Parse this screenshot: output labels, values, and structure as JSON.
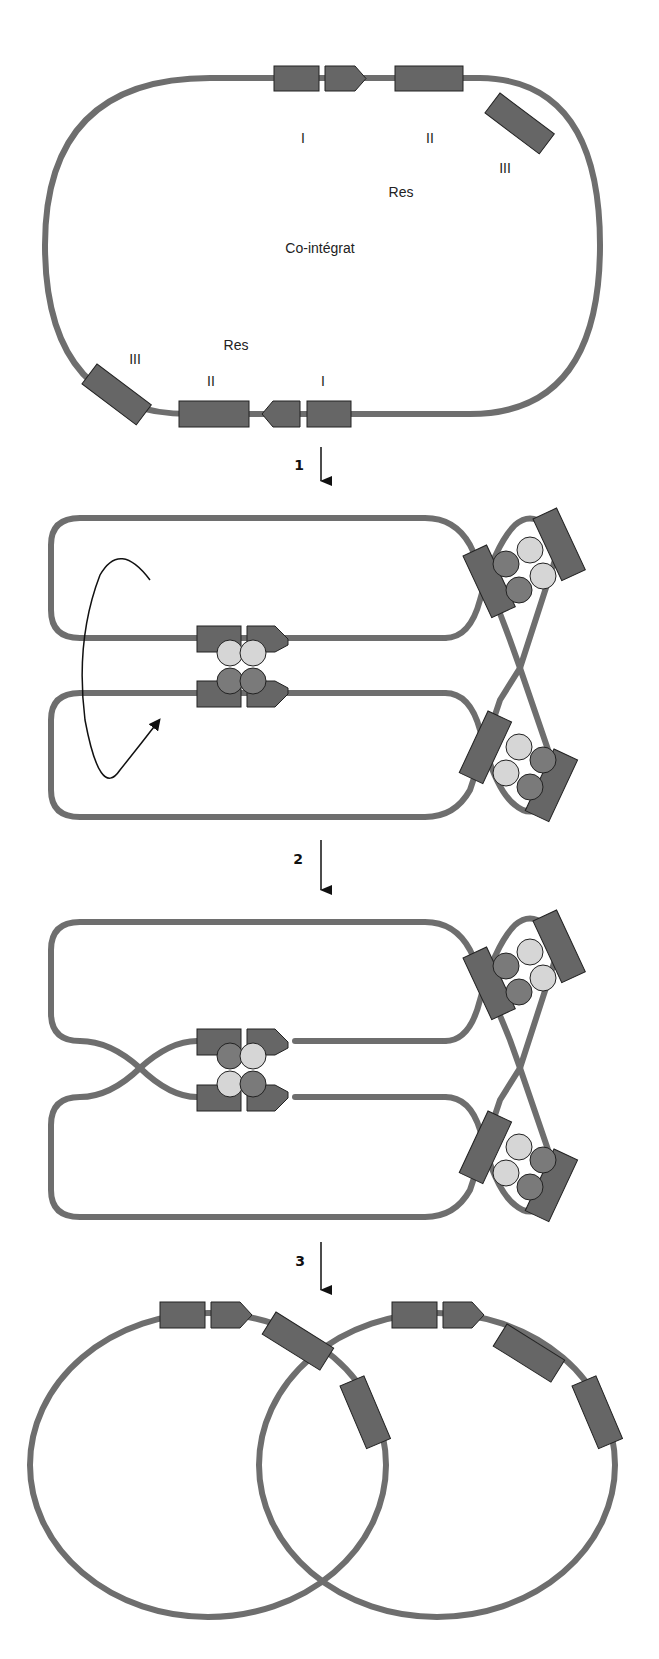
{
  "diagram": {
    "colors": {
      "dna": "#6e6e6e",
      "box": "#666666",
      "light_protein": "#d6d6d6",
      "dark_protein": "#7a7a7a"
    },
    "stage1": {
      "center_label": "Co-intégrat",
      "res_top": "Res",
      "res_bottom": "Res",
      "site_labels_top": [
        "I",
        "II",
        "III"
      ],
      "site_labels_bottom": [
        "III",
        "II",
        "I"
      ]
    },
    "steps": [
      {
        "label": "1"
      },
      {
        "label": "2"
      },
      {
        "label": "3"
      }
    ]
  }
}
